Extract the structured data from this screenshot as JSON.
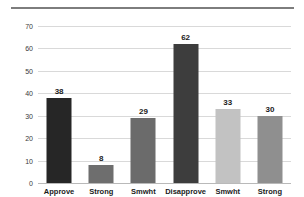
{
  "chart_data": {
    "type": "bar",
    "title": "",
    "subtitle": "",
    "xlabel": "",
    "ylabel": "",
    "categories": [
      "Approve",
      "Strong",
      "Smwht",
      "Disapprove",
      "Smwht",
      "Strong"
    ],
    "values": [
      38,
      8,
      29,
      62,
      33,
      30
    ],
    "bar_colors": [
      "#262626",
      "#6e6e6e",
      "#6b6b6b",
      "#3d3d3d",
      "#c2c2c2",
      "#8f8f8f"
    ],
    "data_labels": [
      "38",
      "8",
      "29",
      "62",
      "33",
      "30"
    ],
    "ylim": [
      0,
      70
    ],
    "yticks": [
      0,
      10,
      20,
      30,
      40,
      50,
      60,
      70
    ],
    "ytick_labels": [
      "0",
      "10",
      "20",
      "30",
      "40",
      "50",
      "60",
      "70"
    ],
    "grid": true,
    "grid_color": "#d9d9d9",
    "legend": "none",
    "background": "#ffffff"
  },
  "decor": {
    "top_rule_color": "#7d7d7d"
  }
}
